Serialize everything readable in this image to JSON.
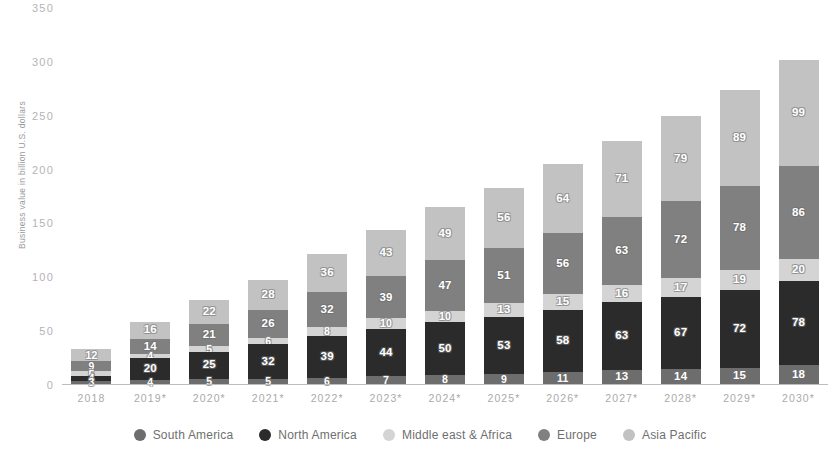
{
  "chart_data": {
    "type": "bar",
    "subtype": "stacked-bar",
    "title": "",
    "xlabel": "",
    "ylabel": "Business value in billion U.S. dollars",
    "ylim": [
      0,
      350
    ],
    "yticks": [
      0,
      50,
      100,
      150,
      200,
      250,
      300,
      350
    ],
    "grid": false,
    "legend_position": "bottom",
    "categories": [
      "2018",
      "2019*",
      "2020*",
      "2021*",
      "2022*",
      "2023*",
      "2024*",
      "2025*",
      "2026*",
      "2027*",
      "2028*",
      "2029*",
      "2030*"
    ],
    "series": [
      {
        "name": "South America",
        "color": "#6d6d6d",
        "values": [
          3,
          4,
          5,
          5,
          6,
          7,
          8,
          9,
          11,
          13,
          14,
          15,
          18
        ]
      },
      {
        "name": "North America",
        "color": "#2b2b2b",
        "values": [
          4,
          20,
          25,
          32,
          39,
          44,
          50,
          53,
          58,
          63,
          67,
          72,
          78
        ]
      },
      {
        "name": "Middle east & Africa",
        "color": "#d4d4d4",
        "values": [
          5,
          4,
          5,
          6,
          8,
          10,
          10,
          13,
          15,
          16,
          17,
          19,
          20
        ]
      },
      {
        "name": "Europe",
        "color": "#808080",
        "values": [
          9,
          14,
          21,
          26,
          32,
          39,
          47,
          51,
          56,
          63,
          72,
          78,
          86
        ]
      },
      {
        "name": "Asia Pacific",
        "color": "#c2c2c2",
        "values": [
          12,
          16,
          22,
          28,
          36,
          43,
          49,
          56,
          64,
          71,
          79,
          89,
          99
        ]
      }
    ]
  }
}
